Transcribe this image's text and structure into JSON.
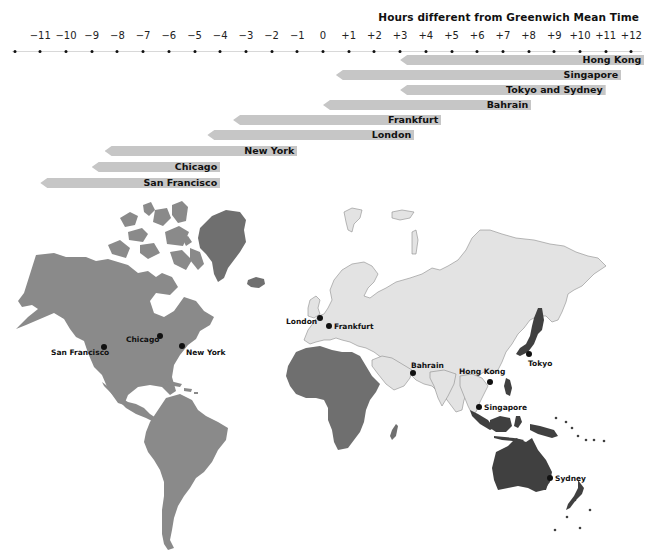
{
  "title": "Hours different from Greenwich Mean Time",
  "axis": {
    "ticks": [
      "−11",
      "−10",
      "−9",
      "−8",
      "−7",
      "−6",
      "−5",
      "−4",
      "−3",
      "−2",
      "−1",
      "0",
      "+1",
      "+2",
      "+3",
      "+4",
      "+5",
      "+6",
      "+7",
      "+8",
      "+9",
      "+10",
      "+11",
      "+12"
    ],
    "tick_values": [
      -11,
      -10,
      -9,
      -8,
      -7,
      -6,
      -5,
      -4,
      -3,
      -2,
      -1,
      0,
      1,
      2,
      3,
      4,
      5,
      6,
      7,
      8,
      9,
      10,
      11,
      12
    ],
    "range": [
      -12,
      12.5
    ],
    "zero_x": 323,
    "px_per_hour": 25.7
  },
  "bars": [
    {
      "label": "Hong Kong",
      "start": 3,
      "end": 12.5
    },
    {
      "label": "Singapore",
      "start": 0.5,
      "end": 11.6
    },
    {
      "label": "Tokyo and Sydney",
      "start": 3,
      "end": 11.0
    },
    {
      "label": "Bahrain",
      "start": 0,
      "end": 8.1
    },
    {
      "label": "Frankfurt",
      "start": -3.5,
      "end": 4.6
    },
    {
      "label": "London",
      "start": -4.5,
      "end": 3.55
    },
    {
      "label": "New York",
      "start": -8.5,
      "end": -1.0
    },
    {
      "label": "Chicago",
      "start": -9,
      "end": -4.0
    },
    {
      "label": "San Francisco",
      "start": -11,
      "end": -4.0
    }
  ],
  "cities": {
    "san_francisco": "San Francisco",
    "chicago": "Chicago",
    "new_york": "New York",
    "london": "London",
    "frankfurt": "Frankfurt",
    "bahrain": "Bahrain",
    "hong_kong": "Hong Kong",
    "tokyo": "Tokyo",
    "singapore": "Singapore",
    "sydney": "Sydney"
  },
  "colors": {
    "americas": "#8a8a8a",
    "greenland_africa": "#6f6f6f",
    "eurasia": "#e3e3e3",
    "eurasia_outline": "#8c8c8c",
    "asia_pacific": "#404040",
    "bar": "#c6c6c6",
    "text": "#111111"
  },
  "chart_data": {
    "type": "bar",
    "orientation": "horizontal-range",
    "title": "Hours different from Greenwich Mean Time",
    "xlabel": "Hours different from Greenwich Mean Time",
    "x_ticks": [
      -11,
      -10,
      -9,
      -8,
      -7,
      -6,
      -5,
      -4,
      -3,
      -2,
      -1,
      0,
      1,
      2,
      3,
      4,
      5,
      6,
      7,
      8,
      9,
      10,
      11,
      12
    ],
    "xlim": [
      -12,
      12
    ],
    "categories": [
      "Hong Kong",
      "Singapore",
      "Tokyo and Sydney",
      "Bahrain",
      "Frankfurt",
      "London",
      "New York",
      "Chicago",
      "San Francisco"
    ],
    "series": [
      {
        "name": "range_start",
        "values": [
          3,
          0.5,
          3,
          0,
          -3.5,
          -4.5,
          -8.5,
          -9,
          -11
        ]
      },
      {
        "name": "range_end",
        "values": [
          12.5,
          11.6,
          11,
          8.1,
          4.6,
          3.55,
          -1,
          -4,
          -4
        ]
      }
    ],
    "grid": false,
    "legend": "none"
  }
}
